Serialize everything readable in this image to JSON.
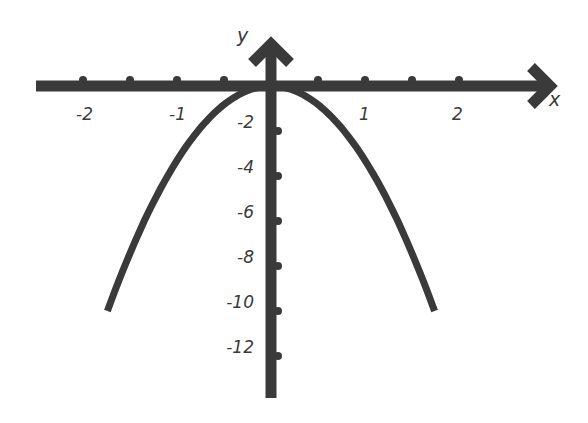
{
  "chart_data": {
    "type": "line",
    "title": "",
    "xlabel": "x",
    "ylabel": "y",
    "function": "downward parabola with vertex at origin (approx. y = -3.3x^2)",
    "xlim": [
      -2.5,
      3
    ],
    "ylim": [
      -14,
      1
    ],
    "grid": false,
    "x_ticks": [
      -2,
      -1.5,
      -1,
      -0.5,
      0.5,
      1,
      1.5,
      2
    ],
    "x_tick_labels": [
      "-2",
      "-1",
      "1",
      "2"
    ],
    "y_ticks": [
      -2,
      -4,
      -6,
      -8,
      -10,
      -12
    ],
    "y_tick_labels": [
      "-2",
      "-4",
      "-6",
      "-8",
      "-10",
      "-12"
    ],
    "series": [
      {
        "name": "parabola",
        "x": [
          -1.74,
          -1.5,
          -1.25,
          -1.0,
          -0.75,
          -0.5,
          -0.25,
          0,
          0.25,
          0.5,
          0.75,
          1.0,
          1.25,
          1.5,
          1.74
        ],
        "y": [
          -10,
          -7.4,
          -5.2,
          -3.3,
          -1.9,
          -0.8,
          -0.2,
          0,
          -0.2,
          -0.8,
          -1.9,
          -3.3,
          -5.2,
          -7.4,
          -10
        ]
      }
    ],
    "colors": {
      "stroke": "#3a3a3a",
      "background": "#ffffff"
    }
  },
  "labels": {
    "x_axis": "x",
    "y_axis": "y",
    "x_ticks": [
      {
        "text": "-2",
        "value": -2
      },
      {
        "text": "-1",
        "value": -1
      },
      {
        "text": "1",
        "value": 1
      },
      {
        "text": "2",
        "value": 2
      }
    ],
    "y_ticks": [
      {
        "text": "-2",
        "value": -2
      },
      {
        "text": "-4",
        "value": -4
      },
      {
        "text": "-6",
        "value": -6
      },
      {
        "text": "-8",
        "value": -8
      },
      {
        "text": "-10",
        "value": -10
      },
      {
        "text": "-12",
        "value": -12
      }
    ]
  }
}
